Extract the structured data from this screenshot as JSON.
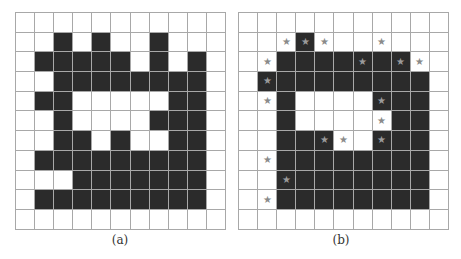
{
  "figure": {
    "grid_size": {
      "rows": 11,
      "cols": 11
    },
    "colors": {
      "filled": "#2b2b2b",
      "empty": "#ffffff",
      "gridline": "#a8a8a8",
      "star": "#8a8a8a"
    },
    "star_glyph": "★",
    "panels": [
      {
        "caption": "(a)",
        "cells": [
          "00000000000",
          "00101001000",
          "01111101010",
          "00111111110",
          "01100000110",
          "00100001110",
          "00110100110",
          "01111111110",
          "00011111110",
          "01111111110",
          "00000000000"
        ],
        "stars": []
      },
      {
        "caption": "(b)",
        "cells": [
          "00000000000",
          "00010000000",
          "00111111100",
          "01111111110",
          "00100001110",
          "00100000110",
          "00111001110",
          "00111111110",
          "00111111110",
          "00111111110",
          "00000000000"
        ],
        "stars": [
          [
            1,
            2
          ],
          [
            1,
            3
          ],
          [
            1,
            4
          ],
          [
            1,
            7
          ],
          [
            2,
            1
          ],
          [
            2,
            6
          ],
          [
            2,
            8
          ],
          [
            2,
            9
          ],
          [
            3,
            1
          ],
          [
            4,
            1
          ],
          [
            4,
            7
          ],
          [
            5,
            7
          ],
          [
            6,
            4
          ],
          [
            6,
            5
          ],
          [
            6,
            7
          ],
          [
            7,
            1
          ],
          [
            8,
            2
          ],
          [
            9,
            1
          ]
        ]
      }
    ]
  }
}
